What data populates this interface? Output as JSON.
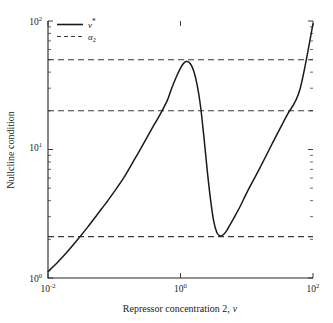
{
  "chart_data": {
    "type": "line",
    "title": "",
    "xlabel": "Repressor concentration 2, v",
    "xlabel_plain": "Repressor concentration 2,",
    "xlabel_italic": "v",
    "ylabel": "Nullcline condition",
    "xscale": "log",
    "yscale": "log",
    "xlim": [
      0.01,
      100
    ],
    "ylim": [
      1,
      100
    ],
    "grid": false,
    "legend_position": "top-left",
    "xticks": [
      {
        "value": 0.01,
        "mantissa": "10",
        "exponent": "-2",
        "label": "10^-2"
      },
      {
        "value": 1,
        "mantissa": "10",
        "exponent": "0",
        "label": "10^0"
      },
      {
        "value": 100,
        "mantissa": "10",
        "exponent": "2",
        "label": "10^2"
      }
    ],
    "yticks": [
      {
        "value": 1,
        "mantissa": "10",
        "exponent": "0",
        "label": "10^0"
      },
      {
        "value": 10,
        "mantissa": "10",
        "exponent": "1",
        "label": "10^1"
      },
      {
        "value": 100,
        "mantissa": "10",
        "exponent": "2",
        "label": "10^2"
      }
    ],
    "series": [
      {
        "name": "v*",
        "name_base": "v",
        "name_super": "*",
        "style": "solid",
        "color": "#1a1a1a",
        "points": [
          [
            0.01,
            1.12
          ],
          [
            0.0141,
            1.33
          ],
          [
            0.02,
            1.62
          ],
          [
            0.0282,
            2.0
          ],
          [
            0.04,
            2.5
          ],
          [
            0.0562,
            3.15
          ],
          [
            0.08,
            4.0
          ],
          [
            0.1,
            4.7
          ],
          [
            0.141,
            6.1
          ],
          [
            0.2,
            8.3
          ],
          [
            0.282,
            11.3
          ],
          [
            0.4,
            15.6
          ],
          [
            0.5,
            19.0
          ],
          [
            0.63,
            24.0
          ],
          [
            0.72,
            29.0
          ],
          [
            0.85,
            36.0
          ],
          [
            1.0,
            43.0
          ],
          [
            1.12,
            47.0
          ],
          [
            1.26,
            48.5
          ],
          [
            1.41,
            46.5
          ],
          [
            1.58,
            41.0
          ],
          [
            1.78,
            32.0
          ],
          [
            2.0,
            22.0
          ],
          [
            2.24,
            13.0
          ],
          [
            2.51,
            7.2
          ],
          [
            2.82,
            4.2
          ],
          [
            3.16,
            2.8
          ],
          [
            3.55,
            2.25
          ],
          [
            3.98,
            2.12
          ],
          [
            4.47,
            2.18
          ],
          [
            5.01,
            2.35
          ],
          [
            6.31,
            2.9
          ],
          [
            7.94,
            3.6
          ],
          [
            10.0,
            4.6
          ],
          [
            15.8,
            7.2
          ],
          [
            25.1,
            11.5
          ],
          [
            39.8,
            18.2
          ],
          [
            63.1,
            29.0
          ],
          [
            100.0,
            95.0
          ]
        ]
      }
    ],
    "threshold_lines": [
      {
        "name": "alpha_2_high",
        "value": 50.0,
        "style": "dashed",
        "color": "#3a3a3a"
      },
      {
        "name": "alpha_2_mid",
        "value": 20.0,
        "style": "dashed",
        "color": "#3a3a3a"
      },
      {
        "name": "alpha_2_low",
        "value": 2.1,
        "style": "dashed",
        "color": "#3a3a3a"
      }
    ],
    "legend": [
      {
        "label": "v*",
        "base": "v",
        "super": "*",
        "style": "solid"
      },
      {
        "label": "a2",
        "base": "α",
        "sub": "2",
        "style": "dashed"
      }
    ]
  },
  "colors": {
    "background": "#ffffff",
    "axis": "#262626",
    "curve": "#1a1a1a",
    "threshold": "#3a3a3a"
  }
}
